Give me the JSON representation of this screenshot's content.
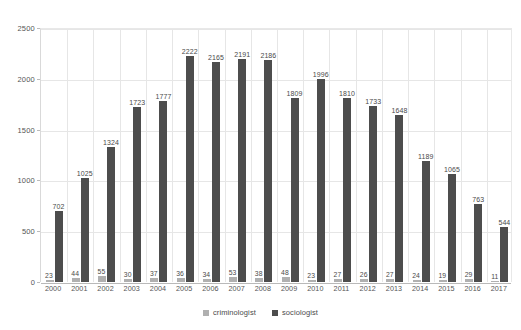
{
  "chart_data": {
    "type": "bar",
    "title": "",
    "subtitle": "",
    "xlabel": "",
    "ylabel": "",
    "ylim": [
      0,
      2500
    ],
    "yticks": [
      0,
      500,
      1000,
      1500,
      2000,
      2500
    ],
    "grid": true,
    "legend_position": "bottom",
    "categories": [
      "2000",
      "2001",
      "2002",
      "2003",
      "2004",
      "2005",
      "2006",
      "2007",
      "2008",
      "2009",
      "2010",
      "2011",
      "2012",
      "2013",
      "2014",
      "2015",
      "2016",
      "2017"
    ],
    "series": [
      {
        "name": "criminologist",
        "color": "#b0b0b0",
        "values": [
          23,
          44,
          55,
          30,
          37,
          36,
          34,
          53,
          38,
          48,
          23,
          27,
          26,
          27,
          24,
          19,
          29,
          11
        ]
      },
      {
        "name": "sociologist",
        "color": "#4d4d4d",
        "values": [
          702,
          1025,
          1324,
          1723,
          1777,
          2222,
          2165,
          2191,
          2186,
          1809,
          1996,
          1810,
          1733,
          1648,
          1189,
          1065,
          763,
          544
        ]
      }
    ]
  },
  "legend": {
    "items": [
      {
        "label": "criminologist",
        "color": "#b0b0b0"
      },
      {
        "label": "sociologist",
        "color": "#4d4d4d"
      }
    ]
  }
}
